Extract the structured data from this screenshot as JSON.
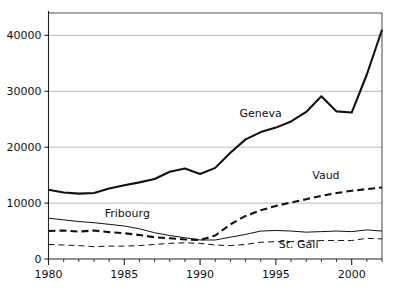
{
  "chart_data": {
    "type": "line",
    "title": "",
    "subtitle": "",
    "xlabel": "",
    "ylabel": "",
    "xlim": [
      1980,
      2002
    ],
    "ylim": [
      0,
      44000
    ],
    "grid": true,
    "legend_position": "inline-labels",
    "x": [
      1980,
      1981,
      1982,
      1983,
      1984,
      1985,
      1986,
      1987,
      1988,
      1989,
      1990,
      1991,
      1992,
      1993,
      1994,
      1995,
      1996,
      1997,
      1998,
      1999,
      2000,
      2001,
      2002
    ],
    "y_ticks": [
      0,
      10000,
      20000,
      30000,
      40000
    ],
    "y_tick_labels": [
      "0",
      "10000",
      "20000",
      "30000",
      "40000"
    ],
    "x_ticks": [
      1980,
      1985,
      1990,
      1995,
      2000
    ],
    "x_tick_labels": [
      "1980",
      "1985",
      "1990",
      "1995",
      "2000"
    ],
    "x_minor_tick_step": 1,
    "series": [
      {
        "name": "Geneva",
        "label": "Geneva",
        "style": "solid-thick",
        "color": "#111111",
        "label_x": 1994.0,
        "label_y": 25400,
        "values": [
          12400,
          11900,
          11700,
          11800,
          12600,
          13200,
          13700,
          14300,
          15600,
          16200,
          15200,
          16300,
          19000,
          21400,
          22700,
          23500,
          24600,
          26300,
          29100,
          26400,
          26200,
          33000,
          41000
        ]
      },
      {
        "name": "Vaud",
        "label": "Vaud",
        "style": "dashed-thick",
        "color": "#111111",
        "label_x": 1998.3,
        "label_y": 14300,
        "values": [
          5000,
          5100,
          4900,
          5100,
          4800,
          4600,
          4300,
          3900,
          3700,
          3500,
          3400,
          4200,
          6200,
          7700,
          8700,
          9500,
          10100,
          10700,
          11300,
          11800,
          12200,
          12500,
          12800
        ]
      },
      {
        "name": "Fribourg",
        "label": "Fribourg",
        "style": "solid-thin",
        "color": "#111111",
        "label_x": 1985.2,
        "label_y": 7600,
        "values": [
          7300,
          7000,
          6700,
          6500,
          6200,
          5900,
          5400,
          4700,
          4200,
          3800,
          3400,
          3400,
          3900,
          4400,
          5000,
          5100,
          5000,
          4800,
          4900,
          5000,
          4900,
          5200,
          5000
        ]
      },
      {
        "name": "St. Gall",
        "label": "St. Gall",
        "style": "dashed-thin",
        "color": "#111111",
        "label_x": 1996.5,
        "label_y": 1950,
        "values": [
          2600,
          2500,
          2400,
          2200,
          2300,
          2300,
          2400,
          2600,
          2800,
          2900,
          2800,
          2500,
          2400,
          2600,
          3000,
          3100,
          3100,
          3200,
          3300,
          3300,
          3300,
          3700,
          3600
        ]
      }
    ]
  },
  "axes": {
    "y_axis_name": "y-axis",
    "x_axis_name": "x-axis"
  },
  "colors": {
    "line": "#111111",
    "grid": "#aaaaaa",
    "frame": "#555555",
    "background": "#ffffff"
  }
}
